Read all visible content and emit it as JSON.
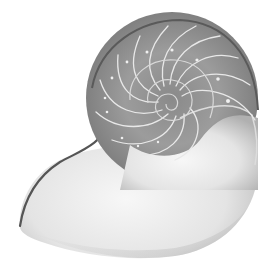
{
  "image": {
    "subject": "nautilus shell cross-section",
    "style": "grayscale photograph",
    "background_color": "#ffffff",
    "colors": {
      "chamber_dark": "#6e6e6e",
      "chamber_mid": "#9a9a9a",
      "septa_light": "#e6e6e6",
      "body_whorl_light": "#f2f2f2",
      "body_whorl_shadow": "#b4b4b4",
      "outline": "#555555"
    }
  }
}
